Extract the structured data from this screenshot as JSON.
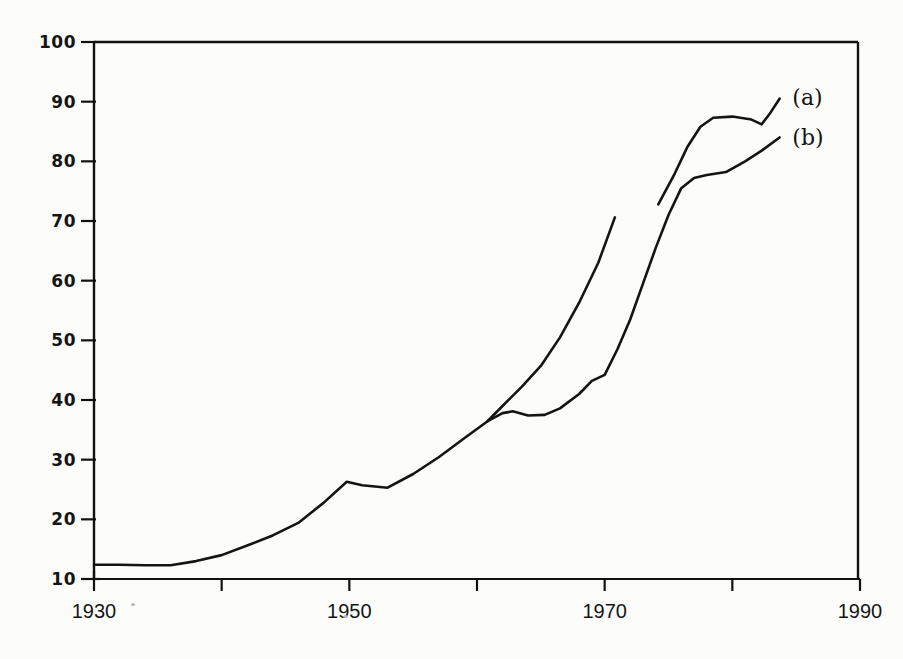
{
  "chart_data": {
    "type": "line",
    "title": "",
    "xlabel": "",
    "ylabel": "",
    "xlim": [
      1930,
      1990
    ],
    "ylim": [
      10,
      100
    ],
    "grid": false,
    "legend_position": "right-inline",
    "x_ticks": [
      1930,
      1940,
      1950,
      1960,
      1970,
      1980,
      1990
    ],
    "x_tick_labels": [
      "1930",
      "",
      "1950",
      "",
      "1970",
      "",
      "1990"
    ],
    "y_ticks": [
      10,
      20,
      30,
      40,
      50,
      60,
      70,
      80,
      90,
      100
    ],
    "y_tick_labels": [
      "10",
      "20",
      "30",
      "40",
      "50",
      "60",
      "70",
      "80",
      "90",
      "100"
    ],
    "series": [
      {
        "name": "(a)",
        "label": "(a)",
        "note": "shared trunk 1930-1960.8 then upper branch; line is broken between 1970.8 and 1974.2",
        "color": "#141414",
        "x": [
          1930,
          1932,
          1934,
          1936,
          1938,
          1940,
          1942,
          1944,
          1946,
          1948,
          1949.8,
          1951,
          1953,
          1955,
          1957,
          1959,
          1960.8,
          1962,
          1963.5,
          1965,
          1966.5,
          1968,
          1969.5,
          1970.8
        ],
        "values": [
          12.4,
          12.4,
          12.3,
          12.3,
          13.0,
          14.0,
          15.6,
          17.3,
          19.4,
          22.8,
          26.3,
          25.7,
          25.3,
          27.6,
          30.4,
          33.6,
          36.4,
          39.0,
          42.2,
          45.7,
          50.5,
          56.3,
          63.0,
          70.6
        ]
      },
      {
        "name": "(a-resumed)",
        "label": "(a)",
        "note": "continuation of curve (a) after the gap",
        "color": "#141414",
        "x": [
          1974.2,
          1975.5,
          1976.5,
          1977.5,
          1978.5,
          1980,
          1981.5,
          1982.3,
          1983,
          1983.7
        ],
        "values": [
          72.8,
          78.0,
          82.5,
          85.8,
          87.3,
          87.5,
          87.0,
          86.2,
          88.2,
          90.5
        ]
      },
      {
        "name": "(b)",
        "label": "(b)",
        "note": "lower branch, diverges from the trunk at about 1960.8",
        "color": "#141414",
        "x": [
          1960.8,
          1962,
          1962.8,
          1964,
          1965.3,
          1966.5,
          1968,
          1969,
          1970,
          1971,
          1972,
          1973,
          1974,
          1975,
          1976,
          1977,
          1978,
          1979.5,
          1981,
          1982.3,
          1983.7
        ],
        "values": [
          36.4,
          37.8,
          38.1,
          37.4,
          37.5,
          38.6,
          41.0,
          43.2,
          44.2,
          48.5,
          53.5,
          59.5,
          65.5,
          71.0,
          75.5,
          77.2,
          77.7,
          78.2,
          80.0,
          81.8,
          84.0
        ]
      }
    ],
    "annotations": [
      {
        "text": "(a)",
        "x": 1984.7,
        "y": 90.8
      },
      {
        "text": "(b)",
        "x": 1984.7,
        "y": 84.0
      }
    ],
    "style": {
      "line_color": "#141414",
      "axis_color": "#101010",
      "background": "#fcfcfb",
      "frame": "top-left-right-bottom-partial"
    }
  },
  "axis": {
    "y_labels": [
      "100",
      "90",
      "80",
      "70",
      "60",
      "50",
      "40",
      "30",
      "20",
      "10"
    ],
    "x_labels": [
      "1930",
      "1950",
      "1970",
      "1990"
    ]
  }
}
